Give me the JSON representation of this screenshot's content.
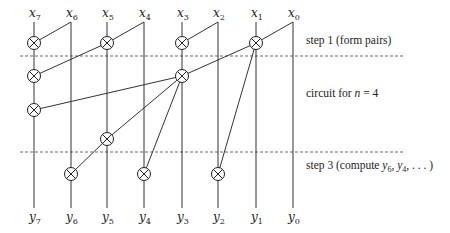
{
  "diagram": {
    "inputs": [
      {
        "name": "x",
        "sub": "7",
        "x": 34
      },
      {
        "name": "x",
        "sub": "6",
        "x": 71
      },
      {
        "name": "x",
        "sub": "5",
        "x": 107
      },
      {
        "name": "x",
        "sub": "4",
        "x": 144
      },
      {
        "name": "x",
        "sub": "3",
        "x": 182
      },
      {
        "name": "x",
        "sub": "2",
        "x": 218
      },
      {
        "name": "x",
        "sub": "1",
        "x": 256
      },
      {
        "name": "x",
        "sub": "0",
        "x": 293
      }
    ],
    "outputs": [
      {
        "name": "y",
        "sub": "7"
      },
      {
        "name": "y",
        "sub": "6"
      },
      {
        "name": "y",
        "sub": "5"
      },
      {
        "name": "y",
        "sub": "4"
      },
      {
        "name": "y",
        "sub": "3"
      },
      {
        "name": "y",
        "sub": "2"
      },
      {
        "name": "y",
        "sub": "1"
      },
      {
        "name": "y",
        "sub": "0"
      }
    ],
    "notes": {
      "step1": "step 1 (form pairs)",
      "middle_prefix": "circuit for ",
      "middle_var": "n",
      "middle_suffix": " = 4",
      "step3_prefix": "step 3 (compute ",
      "step3_y6": "y",
      "step3_y6_sub": "6",
      "step3_sep": ", ",
      "step3_y4": "y",
      "step3_y4_sub": "4",
      "step3_suffix": ", . . . )"
    },
    "gates": [
      {
        "target": "x7",
        "source": "x6",
        "stage": "step1"
      },
      {
        "target": "x5",
        "source": "x4",
        "stage": "step1"
      },
      {
        "target": "x3",
        "source": "x2",
        "stage": "step1"
      },
      {
        "target": "x1",
        "source": "x0",
        "stage": "step1"
      },
      {
        "target": "x7",
        "source": "x5",
        "stage": "middle"
      },
      {
        "target": "x3",
        "source": "x1",
        "stage": "middle"
      },
      {
        "target": "x7",
        "source": "x3",
        "stage": "middle"
      },
      {
        "target": "x5",
        "source": "x3",
        "stage": "middle"
      },
      {
        "target": "x6",
        "source": "x5",
        "stage": "step3"
      },
      {
        "target": "x4",
        "source": "x3",
        "stage": "step3"
      },
      {
        "target": "x2",
        "source": "x1",
        "stage": "step3"
      }
    ],
    "gate_symbol": "otimes-icon"
  }
}
